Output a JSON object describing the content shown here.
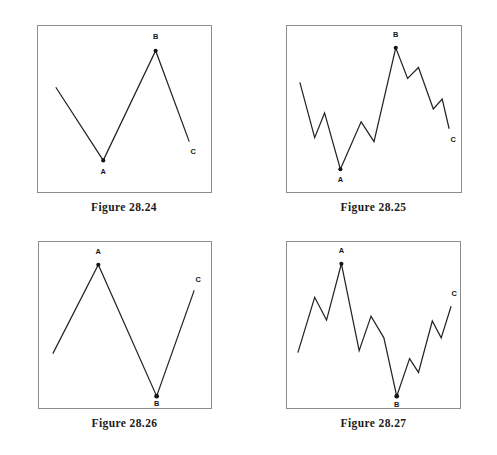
{
  "page": {
    "background": "#ffffff",
    "width": 497,
    "height": 455,
    "line_color": "#242424",
    "frame_color": "#8d8d8d",
    "label_color": "#151515"
  },
  "figures": [
    {
      "id": "figure-28-24",
      "caption": "Figure 28.24",
      "description": "simple zigzag ABC correction, down-up-down",
      "labels": {
        "a": "A",
        "b": "B",
        "c": "C"
      },
      "viewbox": "0 0 175 168",
      "path": "M 18,62 L 66,136 L 119,25 L 153,117",
      "pivots": [
        {
          "name": "A",
          "x": 66,
          "y": 136,
          "label_x": 66,
          "label_y": 150
        },
        {
          "name": "B",
          "x": 119,
          "y": 25,
          "label_x": 119,
          "label_y": 13
        },
        {
          "name": "C",
          "x": 153,
          "y": 117,
          "label_x": 157,
          "label_y": 130
        }
      ]
    },
    {
      "id": "figure-28-25",
      "caption": "Figure 28.25",
      "description": "detailed zigzag ABC correction with internal subwaves, down-up-down",
      "labels": {
        "a": "A",
        "b": "B",
        "c": "C"
      },
      "viewbox": "0 0 176 168",
      "path": "M 13,57 L 28,113 L 38,88 L 54,145 L 75,97 L 88,117 L 110,22 L 122,53 L 133,42 L 148,84 L 157,74 L 164,104",
      "pivots": [
        {
          "name": "A",
          "x": 54,
          "y": 145,
          "label_x": 54,
          "label_y": 158
        },
        {
          "name": "B",
          "x": 110,
          "y": 22,
          "label_x": 110,
          "label_y": 11
        },
        {
          "name": "C",
          "x": 164,
          "y": 104,
          "label_x": 168,
          "label_y": 117
        }
      ]
    },
    {
      "id": "figure-28-26",
      "caption": "Figure 28.26",
      "description": "inverted simple zigzag ABC correction, up-down-up",
      "labels": {
        "a": "A",
        "b": "B",
        "c": "C"
      },
      "viewbox": "0 0 174 168",
      "path": "M 14,113 L 60,23 L 119,156 L 157,49",
      "pivots": [
        {
          "name": "A",
          "x": 60,
          "y": 23,
          "label_x": 60,
          "label_y": 12
        },
        {
          "name": "B",
          "x": 119,
          "y": 156,
          "label_x": 119,
          "label_y": 166
        },
        {
          "name": "C",
          "x": 157,
          "y": 49,
          "label_x": 161,
          "label_y": 40
        }
      ]
    },
    {
      "id": "figure-28-27",
      "caption": "Figure 28.27",
      "description": "inverted detailed zigzag ABC correction with internal subwaves, up-down-up",
      "labels": {
        "a": "A",
        "b": "B",
        "c": "C"
      },
      "viewbox": "0 0 175 168",
      "path": "M 11,112 L 28,56 L 40,79 L 55,22 L 73,110 L 85,75 L 98,97 L 111,156 L 124,118 L 133,132 L 147,80 L 156,97 L 166,65",
      "pivots": [
        {
          "name": "A",
          "x": 55,
          "y": 22,
          "label_x": 55,
          "label_y": 11
        },
        {
          "name": "B",
          "x": 111,
          "y": 156,
          "label_x": 111,
          "label_y": 167
        },
        {
          "name": "C",
          "x": 166,
          "y": 65,
          "label_x": 169,
          "label_y": 55
        }
      ]
    }
  ]
}
